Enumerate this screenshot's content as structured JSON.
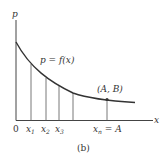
{
  "figure": {
    "caption": "(b)",
    "axes": {
      "y_label": "p",
      "x_label": "x",
      "origin_label": "0"
    },
    "curve": {
      "label": "p = f(x)",
      "color": "#333333"
    },
    "point": {
      "label": "(A, B)"
    },
    "ticks": [
      {
        "base": "x",
        "sub": "1"
      },
      {
        "base": "x",
        "sub": "2"
      },
      {
        "base": "x",
        "sub": "3"
      }
    ],
    "last_tick": {
      "base": "x",
      "sub": "n",
      "suffix": " = A"
    }
  }
}
